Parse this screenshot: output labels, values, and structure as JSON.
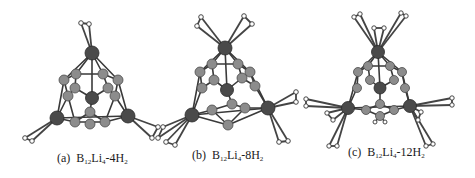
{
  "figure": {
    "panels": [
      {
        "id": "a",
        "label_prefix": "(a)",
        "formula": {
          "B": "B",
          "B_sub": "12",
          "Li": "Li",
          "Li_sub": "4",
          "sep": "-",
          "H_coef": "4",
          "H": "H",
          "H_sub": "2"
        },
        "description": "B12Li4 cluster with 4 adsorbed H2 molecules"
      },
      {
        "id": "b",
        "label_prefix": "(b)",
        "formula": {
          "B": "B",
          "B_sub": "12",
          "Li": "Li",
          "Li_sub": "4",
          "sep": "-",
          "H_coef": "8",
          "H": "H",
          "H_sub": "2"
        },
        "description": "B12Li4 cluster with 8 adsorbed H2 molecules"
      },
      {
        "id": "c",
        "label_prefix": "(c)",
        "formula": {
          "B": "B",
          "B_sub": "12",
          "Li": "Li",
          "Li_sub": "4",
          "sep": "-",
          "H_coef": "12",
          "H": "H",
          "H_sub": "2"
        },
        "description": "B12Li4 cluster with 12 adsorbed H2 molecules"
      }
    ],
    "colors": {
      "li_atom": "#4a4a4a",
      "b_atom": "#8c8c8c",
      "h_atom": "#ffffff",
      "bond": "#3a3a3a",
      "background": "#ffffff"
    }
  }
}
